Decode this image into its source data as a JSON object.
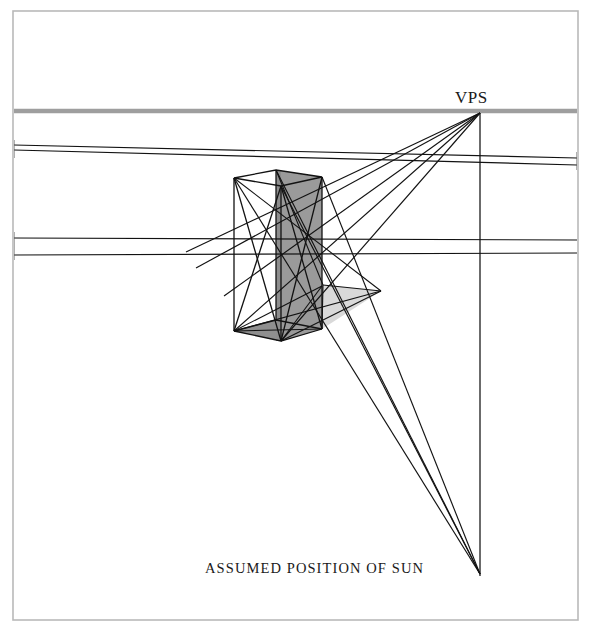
{
  "figure": {
    "kind": "perspective-shadow-construction",
    "background_color": "#ffffff",
    "frame": {
      "name": "plate-border",
      "x": 13,
      "y": 11,
      "width": 565,
      "height": 609,
      "stroke_color": "#b9b9b9",
      "stroke_width": 1.6
    },
    "labels": {
      "vps": "VPS",
      "sun": "ASSUMED POSITION OF SUN"
    },
    "colors": {
      "horizon": "#9e9e9e",
      "line": "#121212",
      "box_dark_face": "#9a9a9a",
      "box_mid_face": "#a5a5a5",
      "box_shadow_base": "#8f8f8f",
      "ground_shadow": "#d9d9d9",
      "frame": "#b9b9b9",
      "text": "#1a1a1a"
    },
    "points": {
      "vps": {
        "label": "VPS",
        "x": 480,
        "y": 113
      },
      "sun": {
        "label": "ASSUMED POSITION OF SUN",
        "x": 480,
        "y": 573
      },
      "horizon_y": 111,
      "box_top_left": {
        "x": 234,
        "y": 178
      },
      "box_top_front": {
        "x": 281,
        "y": 186
      },
      "box_top_right": {
        "x": 322,
        "y": 177
      },
      "box_top_back": {
        "x": 276,
        "y": 170
      },
      "box_bottom_left": {
        "x": 234,
        "y": 331
      },
      "box_bottom_front": {
        "x": 281,
        "y": 341
      },
      "box_bottom_right": {
        "x": 322,
        "y": 329
      },
      "shadow_near": {
        "x": 233,
        "y": 330
      },
      "shadow_far": {
        "x": 379,
        "y": 292
      }
    },
    "geometry": {
      "horizon_line": {
        "name": "horizon-line",
        "x1": 13,
        "y1": 111,
        "x2": 578,
        "y2": 111,
        "width": 4.2
      },
      "vps_to_sun": {
        "name": "vertical-sun-axis",
        "x1": 480,
        "y1": 113,
        "x2": 480,
        "y2": 575
      },
      "perspective_rays_left": [
        {
          "name": "upper-convergent-a",
          "x1": 14,
          "y1": 145,
          "x2": 578,
          "y2": 157
        },
        {
          "name": "upper-convergent-b",
          "x1": 14,
          "y1": 150,
          "x2": 578,
          "y2": 163
        },
        {
          "name": "lower-convergent-a",
          "x1": 14,
          "y1": 238,
          "x2": 578,
          "y2": 238
        },
        {
          "name": "lower-convergent-b",
          "x1": 14,
          "y1": 255,
          "x2": 578,
          "y2": 251
        }
      ],
      "vps_rays": [
        {
          "name": "vps-ray-1",
          "x2": 205,
          "y2": 258
        },
        {
          "name": "vps-ray-2",
          "x2": 210,
          "y2": 270
        },
        {
          "name": "vps-ray-3",
          "x2": 228,
          "y2": 296
        },
        {
          "name": "vps-ray-4",
          "x2": 234,
          "y2": 331
        },
        {
          "name": "vps-ray-5",
          "x2": 281,
          "y2": 341
        }
      ],
      "sun_rays": [
        {
          "name": "sun-ray-1",
          "x1": 234,
          "y1": 178
        },
        {
          "name": "sun-ray-2",
          "x1": 276,
          "y1": 170
        },
        {
          "name": "sun-ray-3",
          "x1": 281,
          "y1": 186
        },
        {
          "name": "sun-ray-4",
          "x1": 322,
          "y1": 177
        }
      ],
      "box_faces": [
        {
          "name": "box-face-dark",
          "points": "276,170 322,177 322,329 276,341",
          "fill": "#9a9a9a"
        },
        {
          "name": "box-face-front",
          "points": "234,178 276,170 276,341 234,331",
          "fill": "#ffffff"
        },
        {
          "name": "box-shadow-ground",
          "points": "281,341 322,329 379,292 322,286",
          "fill": "#d9d9d9"
        }
      ]
    }
  }
}
